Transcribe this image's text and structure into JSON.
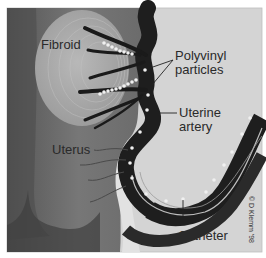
{
  "figure": {
    "labels": {
      "fibroid": "Fibroid",
      "polyvinyl_line1": "Polyvinyl",
      "polyvinyl_line2": "particles",
      "uterine_line1": "Uterine",
      "uterine_line2": "artery",
      "uterus": "Uterus",
      "catheter": "Catheter"
    },
    "copyright": "© D Klemm '98",
    "colors": {
      "background": "#d4d4d4",
      "uterus_wall": "#6e6e6e",
      "fibroid": "#a8a8a8",
      "artery": "#1e1e1e",
      "particles": "#f0f0f0",
      "frame": "#ffffff"
    }
  }
}
